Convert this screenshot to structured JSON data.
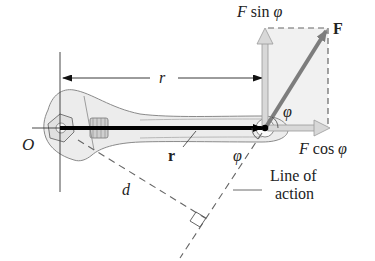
{
  "diagram": {
    "labels": {
      "origin": "O",
      "r_distance": "r",
      "r_vector": "r",
      "moment_arm": "d",
      "force": "F",
      "f_sin_symbol": "F",
      "f_sin_text": " sin ",
      "phi": "φ",
      "f_cos_symbol": "F",
      "f_cos_text": " cos ",
      "angle_top": "φ",
      "angle_bottom": "φ",
      "line_of_action_1": "Line of",
      "line_of_action_2": "action"
    },
    "colors": {
      "background": "#ffffff",
      "wrench_fill": "#e9e9e9",
      "wrench_stroke": "#8a8a8a",
      "r_vector": "#000000",
      "force_vector": "#7d7d7d",
      "component_arrow_fill": "#d8d8d8",
      "component_arrow_stroke": "#9a9a9a",
      "dashed_box_fill": "#f1f1f1",
      "dashed_line": "#666666",
      "text": "#222222"
    }
  }
}
